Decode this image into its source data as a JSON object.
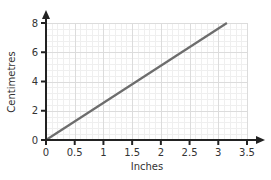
{
  "chart_data": {
    "type": "line",
    "title": "",
    "xlabel": "Inches",
    "ylabel": "Centimetres",
    "xlim": [
      0,
      3.5
    ],
    "ylim": [
      0,
      8
    ],
    "x_ticks": [
      0,
      0.5,
      1,
      1.5,
      2,
      2.5,
      3,
      3.5
    ],
    "x_tick_labels": [
      "0",
      "0.5",
      "1",
      "1.5",
      "2",
      "2.5",
      "3",
      "3.5"
    ],
    "y_ticks": [
      0,
      2,
      4,
      6,
      8
    ],
    "y_tick_labels": [
      "0",
      "2",
      "4",
      "6",
      "8"
    ],
    "grid": true,
    "legend": null,
    "series": [
      {
        "name": "Inches to centimetres conversion",
        "x": [
          0,
          3.15
        ],
        "y": [
          0,
          8
        ],
        "color": "#6d6d6d"
      }
    ]
  },
  "colors": {
    "axis": "#222222",
    "line": "#6d6d6d",
    "grid_major": "#dcdcdc",
    "grid_minor": "#efefef"
  }
}
